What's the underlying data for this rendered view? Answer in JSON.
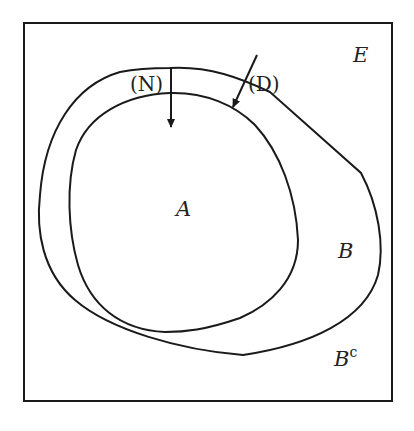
{
  "diagram": {
    "labels": {
      "universe": "E",
      "inner_set": "A",
      "outer_set": "B",
      "complement": "B",
      "complement_sup": "c",
      "arrow_n": "(N)",
      "arrow_d": "(D)"
    },
    "colors": {
      "stroke": "#1a1a1a",
      "background": "#ffffff"
    }
  }
}
